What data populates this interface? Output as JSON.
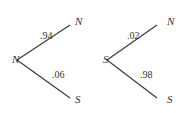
{
  "diagram": {
    "type": "probability-tree",
    "trees": [
      {
        "root": "N",
        "branches": [
          {
            "to": "N",
            "probability": ".94"
          },
          {
            "to": "S",
            "probability": ".06"
          }
        ]
      },
      {
        "root": "S",
        "branches": [
          {
            "to": "N",
            "probability": ".02"
          },
          {
            "to": "S",
            "probability": ".98"
          }
        ]
      }
    ]
  }
}
